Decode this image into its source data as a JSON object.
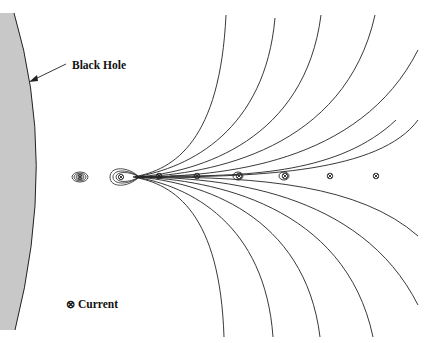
{
  "diagram": {
    "labels": {
      "black_hole": "Black Hole",
      "legend_symbol": "⊗",
      "legend_text": "Current"
    },
    "colors": {
      "black_hole_fill": "#c8c8c8",
      "line": "#222222",
      "background": "#ffffff"
    },
    "currents": [
      {
        "x": 80,
        "y": 177,
        "style": "closed-loops"
      },
      {
        "x": 121,
        "y": 177,
        "style": "x-point-loops"
      },
      {
        "x": 159,
        "y": 176,
        "style": "plain"
      },
      {
        "x": 197,
        "y": 176,
        "style": "plain"
      },
      {
        "x": 239,
        "y": 176,
        "style": "plain"
      },
      {
        "x": 285,
        "y": 176,
        "style": "plain"
      },
      {
        "x": 330,
        "y": 176,
        "style": "plain"
      },
      {
        "x": 376,
        "y": 176,
        "style": "plain"
      }
    ]
  }
}
